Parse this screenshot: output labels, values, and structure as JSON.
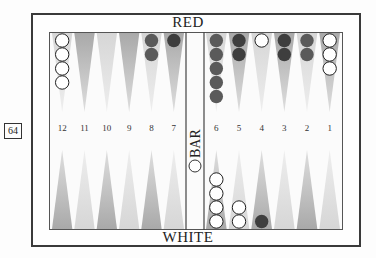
{
  "labels": {
    "top_player": "RED",
    "bottom_player": "WHITE",
    "bar": "BAR",
    "page_number": "64"
  },
  "colors": {
    "red_checker": "#5a5a5a",
    "red_checker_dark": "#3e3e3e",
    "white_checker": "#ffffff",
    "point_dark": "#a9a9a9",
    "point_light": "#d6d6d6",
    "board_border": "#555555"
  },
  "points_top": [
    {
      "label": "12",
      "shade": "light",
      "checkers": {
        "color": "white",
        "count": 4
      }
    },
    {
      "label": "11",
      "shade": "dark",
      "checkers": null
    },
    {
      "label": "10",
      "shade": "light",
      "checkers": null
    },
    {
      "label": "9",
      "shade": "dark",
      "checkers": null
    },
    {
      "label": "8",
      "shade": "light",
      "checkers": {
        "color": "red",
        "count": 2
      }
    },
    {
      "label": "7",
      "shade": "dark",
      "checkers": {
        "color": "red-dark",
        "count": 1
      }
    },
    {
      "label": "6",
      "shade": "light",
      "checkers": {
        "color": "red",
        "count": 5
      }
    },
    {
      "label": "5",
      "shade": "dark",
      "checkers": {
        "color": "red-dark",
        "count": 2
      }
    },
    {
      "label": "4",
      "shade": "light",
      "checkers": {
        "color": "white",
        "count": 1
      }
    },
    {
      "label": "3",
      "shade": "dark",
      "checkers": {
        "color": "red-dark",
        "count": 2
      }
    },
    {
      "label": "2",
      "shade": "light",
      "checkers": {
        "color": "red",
        "count": 2
      }
    },
    {
      "label": "1",
      "shade": "dark",
      "checkers": {
        "color": "white",
        "count": 3
      }
    }
  ],
  "points_bottom": [
    {
      "shade": "dark",
      "checkers": null
    },
    {
      "shade": "light",
      "checkers": null
    },
    {
      "shade": "dark",
      "checkers": null
    },
    {
      "shade": "light",
      "checkers": null
    },
    {
      "shade": "dark",
      "checkers": null
    },
    {
      "shade": "light",
      "checkers": null
    },
    {
      "shade": "dark",
      "checkers": {
        "color": "white",
        "count": 4
      }
    },
    {
      "shade": "light",
      "checkers": {
        "color": "white",
        "count": 2
      }
    },
    {
      "shade": "dark",
      "checkers": {
        "color": "red-dark",
        "count": 1
      }
    },
    {
      "shade": "light",
      "checkers": null
    },
    {
      "shade": "dark",
      "checkers": null
    },
    {
      "shade": "light",
      "checkers": null
    }
  ]
}
